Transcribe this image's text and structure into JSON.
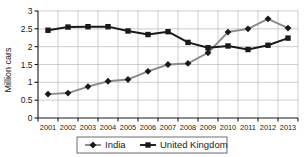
{
  "chart_data": {
    "type": "line",
    "title": "",
    "xlabel": "",
    "ylabel": "Million cars",
    "categories": [
      "2001",
      "2002",
      "2003",
      "2004",
      "2005",
      "2006",
      "2007",
      "2008",
      "2009",
      "2010",
      "2011",
      "2012",
      "2013"
    ],
    "xtick_labels": [
      "2001",
      "2002",
      "2003",
      "2004",
      "2005",
      "2006",
      "2007",
      "2008",
      "2009",
      "2010",
      "2011",
      "2012",
      "2013"
    ],
    "ytick_labels": [
      "0",
      "0.5",
      "1",
      "1.5",
      "2",
      "2.5",
      "3"
    ],
    "ytick_values": [
      0,
      0.5,
      1,
      1.5,
      2,
      2.5,
      3
    ],
    "ylim": [
      0,
      3
    ],
    "grid": true,
    "legend_position": "bottom",
    "series": [
      {
        "name": "India",
        "marker": "diamond",
        "line_color": "#8a8a8a",
        "marker_color": "#1a1a1a",
        "values": [
          0.67,
          0.7,
          0.88,
          1.03,
          1.08,
          1.31,
          1.5,
          1.53,
          1.83,
          2.41,
          2.5,
          2.78,
          2.52
        ]
      },
      {
        "name": "United Kingdom",
        "marker": "square",
        "line_color": "#1a1a1a",
        "marker_color": "#1a1a1a",
        "values": [
          2.46,
          2.55,
          2.56,
          2.56,
          2.44,
          2.34,
          2.42,
          2.12,
          1.97,
          2.02,
          1.92,
          2.04,
          2.24
        ]
      }
    ]
  },
  "legend": {
    "entries": [
      {
        "label": "India",
        "marker": "diamond",
        "color": "#8a8a8a"
      },
      {
        "label": "United Kingdom",
        "marker": "square",
        "color": "#1a1a1a"
      }
    ]
  },
  "axes": {
    "y_title": "Million cars"
  }
}
